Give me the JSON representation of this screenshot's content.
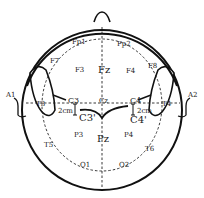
{
  "diagram": {
    "colors": {
      "stroke": "#111111",
      "background": "#ffffff"
    },
    "electrodes": {
      "fp1": "Fp1",
      "fp2": "Fp2",
      "f7": "F7",
      "f3": "F3",
      "fz": "Fz",
      "f4": "F4",
      "f8": "F8",
      "t3": "T3",
      "c3": "C3",
      "cz": "Cz",
      "c4": "C4",
      "t4": "T4",
      "t5": "T5",
      "p3": "P3",
      "pz": "Pz",
      "p4": "P4",
      "t6": "T6",
      "o1": "O1",
      "o2": "O2",
      "a1": "A1",
      "a2": "A2",
      "c3prime": "C3'",
      "c4prime": "C4'"
    },
    "annotations": {
      "left_offset": "2cm",
      "right_offset": "2cm"
    }
  }
}
